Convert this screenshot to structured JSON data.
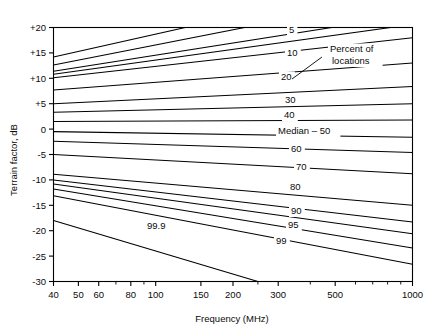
{
  "chart_data": {
    "type": "line",
    "title": "",
    "xlabel": "Frequency (MHz)",
    "ylabel": "Terrain factor, dB",
    "xscale": "log",
    "xlim": [
      40,
      1000
    ],
    "ylim": [
      -30,
      20
    ],
    "grid": false,
    "legend_position": "inline-curve-labels",
    "xticks": [
      "40",
      "50",
      "60",
      "80",
      "100",
      "150",
      "200",
      "300",
      "500",
      "1000"
    ],
    "xtick_values": [
      40,
      50,
      60,
      80,
      100,
      150,
      200,
      300,
      500,
      1000
    ],
    "yticks": [
      "+20",
      "+15",
      "+10",
      "+5",
      "0",
      "-5",
      "-10",
      "-15",
      "-20",
      "-25",
      "-30"
    ],
    "ytick_values": [
      20,
      15,
      10,
      5,
      0,
      -5,
      -10,
      -15,
      -20,
      -25,
      -30
    ],
    "annotations": [
      {
        "text": "Percent of",
        "x": 330,
        "y": 52
      },
      {
        "text": "locations",
        "x": 332,
        "y": 64
      }
    ],
    "leader_line": {
      "x1": 292,
      "y1": 79,
      "x2": 322,
      "y2": 57
    },
    "series": [
      {
        "name": "1",
        "label": "",
        "x": [
          40,
          1000
        ],
        "y": [
          14.2,
          30.0
        ],
        "label_x": 0,
        "label_y": 0
      },
      {
        "name": "2",
        "label": "",
        "x": [
          40,
          1000
        ],
        "y": [
          12.6,
          26.5
        ],
        "label_x": 0,
        "label_y": 0
      },
      {
        "name": "5",
        "label": "5",
        "x": [
          40,
          1000
        ],
        "y": [
          11.4,
          22.5
        ],
        "label_x": 289,
        "label_y": 33
      },
      {
        "name": "5b",
        "label": "",
        "x": [
          40,
          1000
        ],
        "y": [
          10.8,
          20.6
        ],
        "label_x": 0,
        "label_y": 0
      },
      {
        "name": "10",
        "label": "10",
        "x": [
          40,
          1000
        ],
        "y": [
          10.1,
          18.0
        ],
        "label_x": 287,
        "label_y": 56
      },
      {
        "name": "20",
        "label": "20",
        "x": [
          40,
          1000
        ],
        "y": [
          7.7,
          13.0
        ],
        "label_x": 281,
        "label_y": 80
      },
      {
        "name": "30",
        "label": "30",
        "x": [
          40,
          1000
        ],
        "y": [
          5.0,
          8.4
        ],
        "label_x": 285,
        "label_y": 103
      },
      {
        "name": "40",
        "label": "40",
        "x": [
          40,
          1000
        ],
        "y": [
          3.3,
          5.0
        ],
        "label_x": 284,
        "label_y": 118
      },
      {
        "name": "50",
        "label": "Median – 50",
        "x": [
          40,
          1000
        ],
        "y": [
          1.5,
          1.8
        ],
        "label_x": 278,
        "label_y": 134
      },
      {
        "name": "60",
        "label": "60",
        "x": [
          40,
          1000
        ],
        "y": [
          -0.5,
          -1.6
        ],
        "label_x": 291,
        "label_y": 152
      },
      {
        "name": "70",
        "label": "70",
        "x": [
          40,
          1000
        ],
        "y": [
          -2.4,
          -4.6
        ],
        "label_x": 296,
        "label_y": 170
      },
      {
        "name": "80",
        "label": "80",
        "x": [
          40,
          1000
        ],
        "y": [
          -5.0,
          -8.8
        ],
        "label_x": 290,
        "label_y": 190
      },
      {
        "name": "90",
        "label": "90",
        "x": [
          40,
          1000
        ],
        "y": [
          -8.9,
          -15.0
        ],
        "label_x": 291,
        "label_y": 214
      },
      {
        "name": "95",
        "label": "95",
        "x": [
          40,
          1000
        ],
        "y": [
          -10.0,
          -18.3
        ],
        "label_x": 288,
        "label_y": 228
      },
      {
        "name": "97",
        "label": "",
        "x": [
          40,
          1000
        ],
        "y": [
          -10.8,
          -20.6
        ],
        "label_x": 0,
        "label_y": 0
      },
      {
        "name": "98",
        "label": "",
        "x": [
          40,
          1000
        ],
        "y": [
          -11.8,
          -23.4
        ],
        "label_x": 0,
        "label_y": 0
      },
      {
        "name": "99",
        "label": "99",
        "x": [
          40,
          1000
        ],
        "y": [
          -13.1,
          -26.6
        ],
        "label_x": 276,
        "label_y": 244
      },
      {
        "name": "99.9",
        "label": "99.9",
        "x": [
          40,
          250
        ],
        "y": [
          -18.0,
          -30.0
        ],
        "label_x": 147,
        "label_y": 229
      }
    ]
  }
}
